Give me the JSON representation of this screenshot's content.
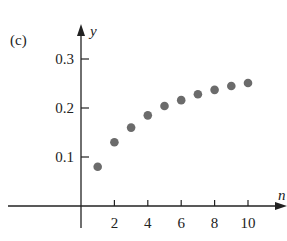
{
  "panel_label": "(c)",
  "chart_data": {
    "type": "scatter",
    "title": "",
    "xlabel": "n",
    "ylabel": "y",
    "x_ticks": [
      "2",
      "4",
      "6",
      "8",
      "10"
    ],
    "y_ticks": [
      "0.1",
      "0.2",
      "0.3"
    ],
    "xlim": [
      -0.5,
      12.5
    ],
    "ylim": [
      0,
      0.35
    ],
    "grid": false,
    "legend": null,
    "x": [
      1,
      2,
      3,
      4,
      5,
      6,
      7,
      8,
      9,
      10
    ],
    "y": [
      0.08,
      0.13,
      0.16,
      0.185,
      0.204,
      0.216,
      0.228,
      0.237,
      0.245,
      0.251
    ],
    "point_color": "#6b6b6b"
  }
}
